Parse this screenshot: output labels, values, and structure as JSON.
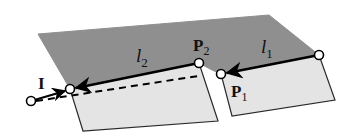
{
  "diagram": {
    "colors": {
      "dark_surface": "#8f8f8f",
      "light_surface": "#e4e4e4",
      "edge": "#2a2a2a",
      "line": "#000000",
      "point_fill": "#ffffff",
      "background": "#ffffff"
    },
    "labels": {
      "l2": {
        "base": "l",
        "sub": "2"
      },
      "l1": {
        "base": "l",
        "sub": "1"
      },
      "P2": {
        "base": "P",
        "sub": "2"
      },
      "P1": {
        "base": "P",
        "sub": "1"
      },
      "I": "I"
    },
    "points": {
      "P2": [
        199,
        63
      ],
      "P1": [
        221,
        74
      ],
      "l1_start": [
        319,
        55
      ],
      "l2_end": [
        70,
        89
      ],
      "I_tail": [
        31,
        101
      ]
    },
    "segments": [
      {
        "name": "l1",
        "from": "l1_start",
        "to": "P1",
        "style": "solid-arrow"
      },
      {
        "name": "l2",
        "from": "P2",
        "to": "l2_end",
        "style": "solid-arrow"
      },
      {
        "name": "I",
        "from": "I_tail",
        "to": "l2_end",
        "style": "solid-arrow"
      },
      {
        "name": "projection",
        "from": "I_tail",
        "to": "P2",
        "style": "dashed"
      }
    ]
  }
}
